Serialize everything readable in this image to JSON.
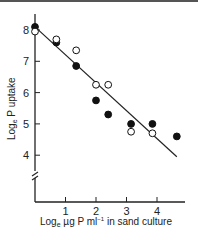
{
  "chart_data": {
    "type": "scatter",
    "title": "",
    "xlabel": "Logₑ µg P ml⁻¹ in sand culture",
    "ylabel": "Logₑ P uptake",
    "xlim": [
      0,
      5
    ],
    "ylim": [
      2.5,
      8.5
    ],
    "y_axis_break": true,
    "grid": false,
    "legend": "none",
    "x_ticks": [
      "1",
      "2",
      "3",
      "4"
    ],
    "y_ticks": [
      "4",
      "5",
      "6",
      "7",
      "8"
    ],
    "series": [
      {
        "name": "filled",
        "marker": "filled-circle",
        "points": [
          {
            "x": 0.0,
            "y": 8.1
          },
          {
            "x": 0.7,
            "y": 7.6
          },
          {
            "x": 1.35,
            "y": 6.85
          },
          {
            "x": 2.0,
            "y": 5.75
          },
          {
            "x": 2.4,
            "y": 5.3
          },
          {
            "x": 3.15,
            "y": 5.0
          },
          {
            "x": 3.85,
            "y": 5.0
          },
          {
            "x": 4.65,
            "y": 4.6
          }
        ]
      },
      {
        "name": "open",
        "marker": "open-circle",
        "points": [
          {
            "x": 0.0,
            "y": 7.95
          },
          {
            "x": 0.7,
            "y": 7.7
          },
          {
            "x": 1.35,
            "y": 7.35
          },
          {
            "x": 2.0,
            "y": 6.25
          },
          {
            "x": 2.4,
            "y": 6.25
          },
          {
            "x": 3.15,
            "y": 4.75
          },
          {
            "x": 3.85,
            "y": 4.7
          }
        ]
      }
    ],
    "fit_line": {
      "x1": 0.0,
      "y1": 8.1,
      "x2": 4.65,
      "y2": 3.95
    }
  },
  "labels": {
    "xlabel_prefix": "Log",
    "xlabel_sub": "e",
    "xlabel_rest": " µg P ml",
    "xlabel_sup": "−1",
    "xlabel_tail": " in sand culture",
    "ylabel_prefix": "Log",
    "ylabel_sub": "e",
    "ylabel_rest": " P uptake"
  }
}
